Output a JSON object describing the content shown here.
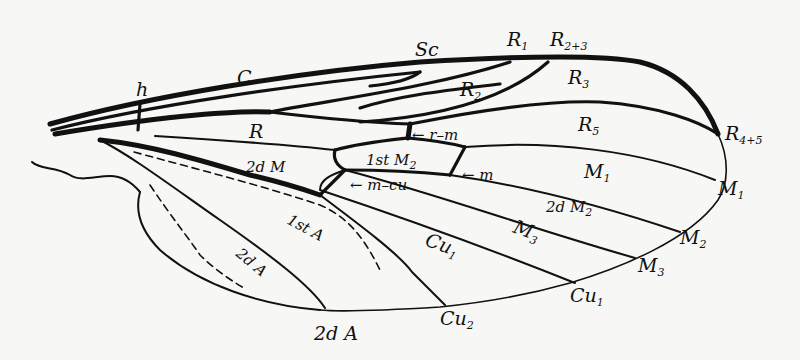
{
  "diagram": {
    "labels": {
      "h": "h",
      "C": "C",
      "Sc": "Sc",
      "R1": {
        "base": "R",
        "sub": "1"
      },
      "R2_3": {
        "base": "R",
        "sub": "2+3"
      },
      "R3": {
        "base": "R",
        "sub": "3"
      },
      "R2": {
        "base": "R",
        "sub": "2"
      },
      "R": "R",
      "r_m": "← r–m",
      "R5": {
        "base": "R",
        "sub": "5"
      },
      "R4_5": {
        "base": "R",
        "sub": "4+5"
      },
      "first_M2": {
        "prefix": "1st M",
        "sub": "2"
      },
      "m": "← m",
      "second_M": "2d M",
      "m_cu": "← m–cu",
      "M1_cell": {
        "base": "M",
        "sub": "1"
      },
      "M1_vein": {
        "base": "M",
        "sub": "1"
      },
      "second_M2": {
        "prefix": "2d M",
        "sub": "2"
      },
      "M2_vein": {
        "base": "M",
        "sub": "2"
      },
      "M3_cell": {
        "base": "M",
        "sub": "3"
      },
      "M3_vein": {
        "base": "M",
        "sub": "3"
      },
      "first_A": "1st A",
      "Cu1_cell": {
        "base": "Cu",
        "sub": "1"
      },
      "Cu1_vein": {
        "base": "Cu",
        "sub": "1"
      },
      "Cu2_vein": {
        "base": "Cu",
        "sub": "2"
      },
      "second_A_cell": "2d A",
      "second_A_vein": "2d A"
    },
    "colors": {
      "ink": "#111111",
      "paper": "#f7f7f5"
    }
  }
}
